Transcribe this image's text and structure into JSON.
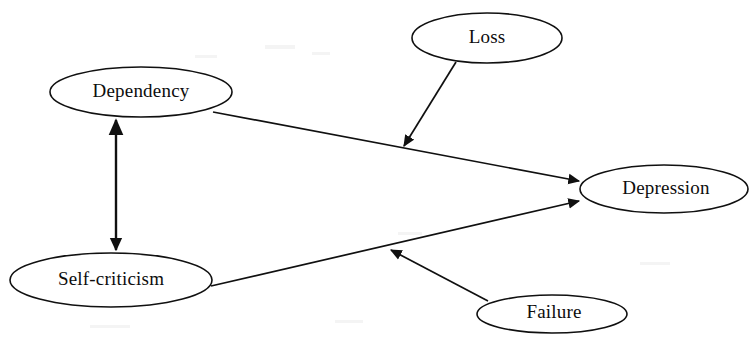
{
  "diagram": {
    "title": "",
    "type": "path-diagram",
    "background_color": "#ffffff",
    "line_color": "#101010",
    "nodes": [
      {
        "id": "loss",
        "label": "Loss",
        "cx": 487,
        "cy": 38,
        "rx": 75,
        "ry": 25
      },
      {
        "id": "dependency",
        "label": "Dependency",
        "cx": 141,
        "cy": 92,
        "rx": 91,
        "ry": 25
      },
      {
        "id": "depression",
        "label": "Depression",
        "cx": 664,
        "cy": 189,
        "rx": 84,
        "ry": 24
      },
      {
        "id": "self-criticism",
        "label": "Self-criticism",
        "cx": 111,
        "cy": 280,
        "rx": 101,
        "ry": 27
      },
      {
        "id": "failure",
        "label": "Failure",
        "cx": 552,
        "cy": 314,
        "rx": 75,
        "ry": 19
      }
    ],
    "edges": [
      {
        "id": "dependency-to-depression",
        "from": "dependency",
        "to": "depression",
        "arrow": "single",
        "x1": 213,
        "y1": 112,
        "x2": 579,
        "y2": 181
      },
      {
        "id": "self-criticism-to-depression",
        "from": "self-criticism",
        "to": "depression",
        "arrow": "single",
        "x1": 211,
        "y1": 286,
        "x2": 579,
        "y2": 201
      },
      {
        "id": "loss-to-dependency-depression-path",
        "from": "loss",
        "to": "dependency-to-depression",
        "arrow": "single",
        "x1": 456,
        "y1": 62,
        "x2": 404,
        "y2": 146
      },
      {
        "id": "failure-to-self-criticism-depression-path",
        "from": "failure",
        "to": "self-criticism-to-depression",
        "arrow": "single",
        "x1": 488,
        "y1": 301,
        "x2": 391,
        "y2": 250
      },
      {
        "id": "dependency-self-criticism-correlation",
        "from": "dependency",
        "to": "self-criticism",
        "arrow": "double",
        "x1": 116,
        "y1": 117,
        "x2": 116,
        "y2": 253
      }
    ]
  }
}
